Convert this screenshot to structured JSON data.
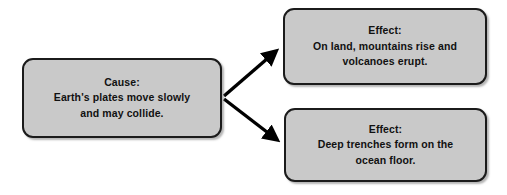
{
  "diagram": {
    "type": "cause-and-effect",
    "background_color": "#ffffff",
    "box_fill_color": "#c9c9c9",
    "box_border_color": "#1b1b1b",
    "text_color": "#111111",
    "arrow_color": "#000000",
    "cause": {
      "label": "Cause:",
      "lines": [
        "Earth's plates move slowly",
        "and may collide."
      ]
    },
    "effects": [
      {
        "label": "Effect:",
        "lines": [
          "On land, mountains rise and",
          "volcanoes erupt."
        ]
      },
      {
        "label": "Effect:",
        "lines": [
          "Deep trenches form on the",
          "ocean floor."
        ]
      }
    ],
    "connectors": [
      {
        "name": "arrow-cause-to-effect-top",
        "from": "cause",
        "to": "effect-top"
      },
      {
        "name": "arrow-cause-to-effect-bottom",
        "from": "cause",
        "to": "effect-bottom"
      }
    ]
  }
}
